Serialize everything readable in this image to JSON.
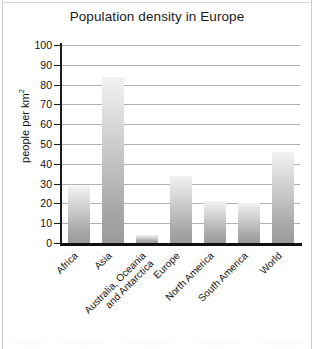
{
  "chart_data": {
    "type": "bar",
    "title": "Population density in Europe",
    "xlabel": "",
    "ylabel": "people per km2",
    "ylabel_base": "people per km",
    "ylabel_exponent": "2",
    "categories": [
      "Africa",
      "Asia",
      "Australia, Oceania\nand Antarctica",
      "Europe",
      "North America",
      "South America",
      "World"
    ],
    "category_lines": [
      [
        "Africa"
      ],
      [
        "Asia"
      ],
      [
        "Australia, Oceania",
        "and Antarctica"
      ],
      [
        "Europe"
      ],
      [
        "North America"
      ],
      [
        "South America"
      ],
      [
        "World"
      ]
    ],
    "values": [
      29,
      84,
      4,
      34,
      21,
      20,
      46
    ],
    "ylim": [
      0,
      100
    ],
    "ytick_values": [
      0,
      10,
      20,
      30,
      40,
      50,
      60,
      70,
      80,
      90,
      100
    ],
    "ytick_labels": [
      "0",
      "10",
      "20",
      "30",
      "40",
      "50",
      "60",
      "70",
      "80",
      "90",
      "100"
    ],
    "grid": "horizontal",
    "legend": "none",
    "bar_fill_top": "#f2f2f2",
    "bar_fill_bottom": "#9a9a9a",
    "gridline_color": "#b0b0b0",
    "axis_color": "#111111",
    "background": "#ffffff"
  }
}
